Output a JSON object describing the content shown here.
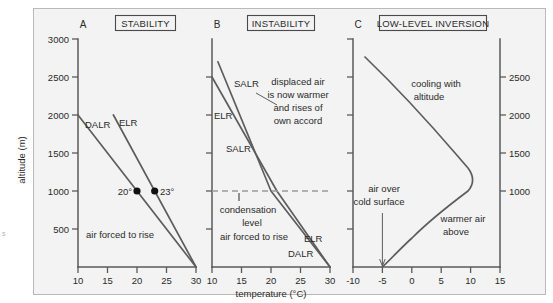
{
  "figure": {
    "axis_title_x": "temperature (°C)",
    "axis_title_y": "altitude (m)",
    "corner_mark": "s"
  },
  "panels": [
    {
      "letter": "A",
      "title": "STABILITY",
      "x_ticks": [
        "10",
        "15",
        "20",
        "25",
        "30"
      ],
      "x_values": [
        10,
        15,
        20,
        25,
        30
      ],
      "y_ticks": [
        "3000",
        "2500",
        "2000",
        "1500",
        "1000",
        "500"
      ],
      "y_values": [
        3000,
        2500,
        2000,
        1500,
        1000,
        500
      ],
      "labels": [
        {
          "name": "dalr-label",
          "text": "DALR"
        },
        {
          "name": "elr-label",
          "text": "ELR"
        },
        {
          "name": "point-20-label",
          "text": "20°"
        },
        {
          "name": "point-23-label",
          "text": "23°"
        },
        {
          "name": "air-forced-label",
          "text": "air forced to rise"
        }
      ]
    },
    {
      "letter": "B",
      "title": "INSTABILITY",
      "x_ticks": [
        "10",
        "15",
        "20",
        "25",
        "30"
      ],
      "x_values": [
        10,
        15,
        20,
        25,
        30
      ],
      "labels": [
        {
          "name": "salr-upper-label",
          "text": "SALR"
        },
        {
          "name": "elr-upper-label",
          "text": "ELR"
        },
        {
          "name": "salr-lower-label",
          "text": "SALR"
        },
        {
          "name": "elr-lower-label",
          "text": "ELR"
        },
        {
          "name": "dalr-label",
          "text": "DALR"
        },
        {
          "name": "condensation-label-line1",
          "text": "condensation"
        },
        {
          "name": "condensation-label-line2",
          "text": "level"
        },
        {
          "name": "air-forced-label",
          "text": "air forced to rise"
        }
      ],
      "annotation": {
        "line1": "displaced air",
        "line2": "is now warmer",
        "line3": "and rises of",
        "line4": "own accord"
      },
      "condensation_level_m": 1000
    },
    {
      "letter": "C",
      "title": "LOW-LEVEL INVERSION",
      "x_ticks": [
        "-10",
        "-5",
        "0",
        "5",
        "10",
        "15"
      ],
      "x_values": [
        -10,
        -5,
        0,
        5,
        10,
        15
      ],
      "y_ticks_right": [
        "2500",
        "2000",
        "1500",
        "1000"
      ],
      "y_values_right": [
        2500,
        2000,
        1500,
        1000
      ],
      "labels": [
        {
          "name": "cooling-label-line1",
          "text": "cooling with"
        },
        {
          "name": "cooling-label-line2",
          "text": "altitude"
        },
        {
          "name": "air-over-cold-line1",
          "text": "air over"
        },
        {
          "name": "air-over-cold-line2",
          "text": "cold surface"
        },
        {
          "name": "warmer-air-line1",
          "text": "warmer air"
        },
        {
          "name": "warmer-air-line2",
          "text": "above"
        }
      ]
    }
  ],
  "chart_data": {
    "type": "line",
    "xlabel": "temperature (°C)",
    "ylabel": "altitude (m)",
    "ylim": [
      0,
      3000
    ],
    "grid": false,
    "legend": "inline curve labels",
    "panels": [
      {
        "panel": "A",
        "panel_title": "STABILITY",
        "xlim": [
          10,
          30
        ],
        "xticks": [
          10,
          15,
          20,
          25,
          30
        ],
        "yticks": [
          500,
          1000,
          1500,
          2000,
          2500,
          3000
        ],
        "series": [
          {
            "name": "DALR",
            "points": [
              [
                30,
                0
              ],
              [
                20,
                1000
              ],
              [
                10,
                2000
              ]
            ],
            "note": "dry adiabatic lapse rate, 10 °C per 1000 m"
          },
          {
            "name": "ELR",
            "points": [
              [
                30,
                0
              ],
              [
                23,
                1000
              ],
              [
                16,
                2000
              ]
            ],
            "note": "environmental lapse rate, 7 °C per 1000 m"
          }
        ],
        "annotations": [
          {
            "text": "20°",
            "x": 20,
            "y": 1000,
            "marker": true
          },
          {
            "text": "23°",
            "x": 23,
            "y": 1000,
            "marker": true
          },
          {
            "text": "air forced to rise",
            "x": 16.5,
            "y": 420
          }
        ]
      },
      {
        "panel": "B",
        "panel_title": "INSTABILITY",
        "xlim": [
          10,
          30
        ],
        "xticks": [
          10,
          15,
          20,
          25,
          30
        ],
        "series": [
          {
            "name": "DALR",
            "points": [
              [
                30,
                0
              ],
              [
                20,
                1000
              ]
            ],
            "note": "below condensation level"
          },
          {
            "name": "SALR",
            "points": [
              [
                20,
                1000
              ],
              [
                15,
                1900
              ],
              [
                11,
                2700
              ]
            ],
            "note": "saturated adiabatic lapse rate above condensation level"
          },
          {
            "name": "ELR",
            "points": [
              [
                30,
                0
              ],
              [
                21,
                1000
              ],
              [
                15,
                1800
              ],
              [
                10,
                2500
              ]
            ],
            "note": "environmental lapse rate, steeper than SALR aloft"
          }
        ],
        "annotations": [
          {
            "text": "displaced air is now warmer and rises of own accord",
            "x": 23,
            "y": 2100
          },
          {
            "text": "condensation level",
            "x": 14.5,
            "y": 820,
            "dashed_level_y": 1000
          },
          {
            "text": "air forced to rise",
            "x": 16,
            "y": 430
          }
        ]
      },
      {
        "panel": "C",
        "panel_title": "LOW-LEVEL INVERSION",
        "xlim": [
          -10,
          15
        ],
        "xticks": [
          -10,
          -5,
          0,
          5,
          10,
          15
        ],
        "yticks_right": [
          1000,
          1500,
          2000,
          2500
        ],
        "series": [
          {
            "name": "inversion profile",
            "points": [
              [
                -5,
                0
              ],
              [
                0,
                400
              ],
              [
                6,
                750
              ],
              [
                9.5,
                1000
              ],
              [
                8,
                1250
              ],
              [
                3,
                1700
              ],
              [
                -3,
                2300
              ],
              [
                -8,
                2750
              ]
            ],
            "note": "temperature increases with height near surface then decreases above the inversion"
          }
        ],
        "annotations": [
          {
            "text": "cooling with altitude",
            "x": 3,
            "y": 2250
          },
          {
            "text": "air over cold surface",
            "x": -5,
            "y": 800,
            "leader_to": [
              -5,
              0
            ]
          },
          {
            "text": "warmer air above",
            "x": 7,
            "y": 520
          }
        ]
      }
    ]
  }
}
